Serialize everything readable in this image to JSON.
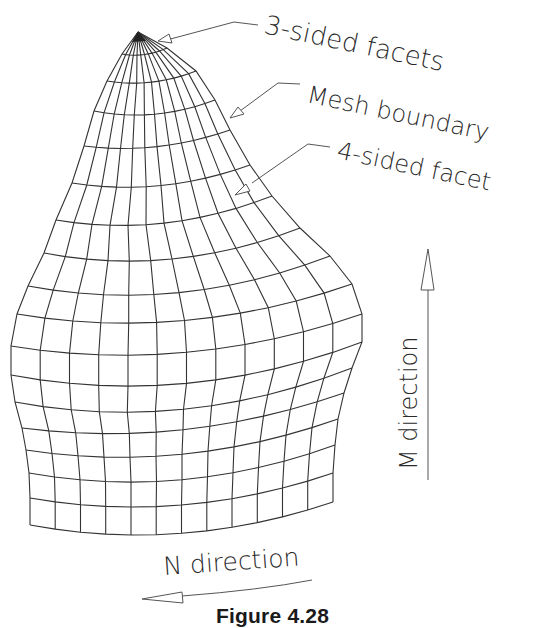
{
  "figure": {
    "caption": "Figure 4.28",
    "stroke_color": "#333333",
    "label_color": "#444444"
  },
  "labels": {
    "three_sided": "3-sided facets",
    "mesh_boundary": "Mesh boundary",
    "four_sided": "4-sided facet",
    "m_direction": "M direction",
    "n_direction": "N direction"
  },
  "mesh": {
    "apex": [
      138,
      32
    ],
    "columns": 12,
    "rows": [
      {
        "left": [
          122,
          54
        ],
        "mid": [
          140,
          55
        ],
        "right": [
          167,
          48
        ]
      },
      {
        "left": [
          107,
          81
        ],
        "mid": [
          140,
          83
        ],
        "right": [
          196,
          71
        ]
      },
      {
        "left": [
          94,
          111
        ],
        "mid": [
          140,
          115
        ],
        "right": [
          215,
          100
        ]
      },
      {
        "left": [
          84,
          146
        ],
        "mid": [
          140,
          148
        ],
        "right": [
          230,
          130
        ]
      },
      {
        "left": [
          72,
          183
        ],
        "mid": [
          140,
          187
        ],
        "right": [
          250,
          165
        ]
      },
      {
        "left": [
          56,
          220
        ],
        "mid": [
          140,
          225
        ],
        "right": [
          272,
          196
        ]
      },
      {
        "left": [
          44,
          253
        ],
        "mid": [
          140,
          261
        ],
        "right": [
          300,
          228
        ]
      },
      {
        "left": [
          28,
          286
        ],
        "mid": [
          140,
          295
        ],
        "right": [
          330,
          256
        ]
      },
      {
        "left": [
          17,
          314
        ],
        "mid": [
          140,
          323
        ],
        "right": [
          352,
          284
        ]
      },
      {
        "left": [
          11,
          346
        ],
        "mid": [
          140,
          355
        ],
        "right": [
          362,
          314
        ]
      },
      {
        "left": [
          11,
          375
        ],
        "mid": [
          140,
          386
        ],
        "right": [
          362,
          342
        ]
      },
      {
        "left": [
          15,
          402
        ],
        "mid": [
          140,
          412
        ],
        "right": [
          352,
          368
        ]
      },
      {
        "left": [
          22,
          428
        ],
        "mid": [
          140,
          433
        ],
        "right": [
          344,
          393
        ]
      },
      {
        "left": [
          26,
          450
        ],
        "mid": [
          140,
          457
        ],
        "right": [
          338,
          419
        ]
      },
      {
        "left": [
          29,
          473
        ],
        "mid": [
          140,
          482
        ],
        "right": [
          335,
          445
        ]
      },
      {
        "left": [
          30,
          498
        ],
        "mid": [
          140,
          507
        ],
        "right": [
          333,
          473
        ]
      },
      {
        "left": [
          30,
          525
        ],
        "mid": [
          140,
          535
        ],
        "right": [
          333,
          502
        ]
      }
    ]
  }
}
